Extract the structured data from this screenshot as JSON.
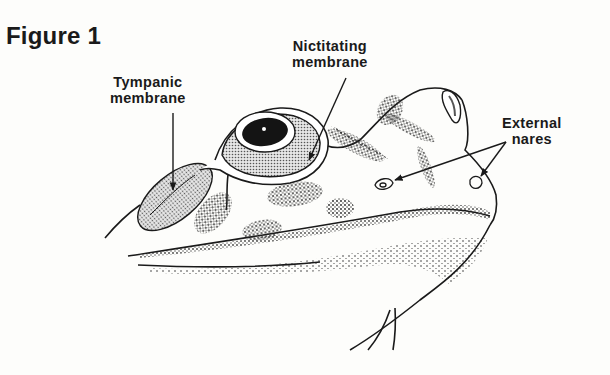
{
  "figure": {
    "title": "Figure 1"
  },
  "labels": [
    {
      "id": "tympanic",
      "line1": "Tympanic",
      "line2": "membrane"
    },
    {
      "id": "nictitating",
      "line1": "Nictitating",
      "line2": "membrane"
    },
    {
      "id": "nares",
      "line1": "External",
      "line2": "nares"
    }
  ],
  "colors": {
    "ink": "#1a1a1a",
    "stipple": "#9a9a9a",
    "background": "#fdfdfb"
  }
}
